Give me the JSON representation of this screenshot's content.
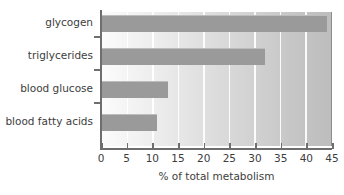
{
  "chart_data": {
    "type": "bar",
    "orientation": "horizontal",
    "title": "",
    "xlabel": "% of total metabolism",
    "ylabel": "",
    "categories": [
      "glycogen",
      "triglycerides",
      "blood glucose",
      "blood fatty acids"
    ],
    "values": [
      44,
      32,
      13,
      11
    ],
    "xlim": [
      0,
      45
    ],
    "xticks": [
      0,
      5,
      10,
      15,
      20,
      25,
      30,
      35,
      40,
      45
    ],
    "xticklabels": [
      "0",
      "5",
      "10",
      "15",
      "20",
      "25",
      "30",
      "35",
      "40",
      "45"
    ],
    "grid": "vertical-white",
    "legend": "none",
    "bar_color": "#9a9a9a",
    "plot_background": "horizontal-gradient-white-to-gray",
    "axis_color": "#6e6e6e",
    "text_color": "#3d3d3d"
  }
}
